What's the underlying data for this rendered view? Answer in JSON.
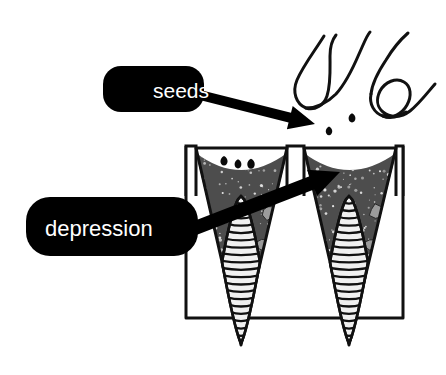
{
  "figure": {
    "background_color": "#ffffff",
    "ink_color": "#111111"
  },
  "callouts": [
    {
      "id": "seeds",
      "label": "seeds",
      "bubble_color": "#000000",
      "text_color": "#ffffff",
      "font_size": 21,
      "bubble": {
        "x": 103,
        "y": 66,
        "width": 101,
        "height": 46,
        "radius": 18
      },
      "text_pos": {
        "x": 153,
        "y": 98
      },
      "arrow": {
        "name": "seeds-arrow",
        "from": {
          "x": 196,
          "y": 94
        },
        "to": {
          "x": 315,
          "y": 124
        },
        "head_length": 26,
        "head_half_width": 12,
        "tail_half_width": 5
      }
    },
    {
      "id": "depression",
      "label": "depression",
      "bubble_color": "#000000",
      "text_color": "#ffffff",
      "font_size": 22,
      "bubble": {
        "x": 26,
        "y": 197,
        "width": 172,
        "height": 59,
        "radius": 24
      },
      "text_pos": {
        "x": 45,
        "y": 236
      },
      "arrow": {
        "name": "depression-arrow",
        "from": {
          "x": 190,
          "y": 230
        },
        "to": {
          "x": 340,
          "y": 172
        },
        "head_length": 30,
        "head_half_width": 14,
        "tail_half_width": 7
      }
    }
  ],
  "tray": {
    "name": "root-trainer-tray",
    "outer_box": {
      "left": 186,
      "top": 146,
      "right": 403,
      "bottom": 318
    },
    "stroke_width": 3,
    "fill": "#ffffff",
    "cells": [
      {
        "name": "cell-left",
        "top_left_x": 196,
        "top_right_x": 287,
        "apex_x": 241,
        "top_y": 148,
        "apex_y": 345,
        "soil_fill": "#4d4d4d",
        "soil_speckle": "#e8e8e8"
      },
      {
        "name": "cell-right",
        "top_left_x": 304,
        "top_right_x": 396,
        "apex_x": 349,
        "top_y": 148,
        "apex_y": 345,
        "soil_fill": "#4d4d4d",
        "soil_speckle": "#e8e8e8"
      }
    ],
    "rim_lips": [
      {
        "name": "rim-lip-left",
        "x1": 186,
        "x2": 196,
        "top": 146,
        "bottom": 196
      },
      {
        "name": "rim-lip-center",
        "x1": 287,
        "x2": 304,
        "top": 146,
        "bottom": 196
      },
      {
        "name": "rim-lip-right",
        "x1": 396,
        "x2": 403,
        "top": 146,
        "bottom": 196
      }
    ]
  },
  "soil": {
    "name": "soil-medium",
    "fill": "#4d4d4d",
    "speckle_color": "#e9e9e9",
    "speckle_count": 260,
    "depression_depth": 22,
    "surface_y_edges": 153,
    "surface_y_center": 175,
    "pebble_color": "#9b9b9b",
    "pebble_stroke": "#2a2a2a",
    "pebbles_per_cell": 4
  },
  "roots": [
    {
      "name": "taproot-left",
      "center_x": 241,
      "top_y": 196,
      "bottom_y": 343,
      "max_half_width": 19,
      "widest_at_y": 262,
      "fill": "#f0f0f0",
      "stroke": "#111111",
      "rib_count": 20
    },
    {
      "name": "taproot-right",
      "center_x": 349,
      "top_y": 196,
      "bottom_y": 343,
      "max_half_width": 19,
      "widest_at_y": 262,
      "fill": "#f0f0f0",
      "stroke": "#111111",
      "rib_count": 20
    }
  ],
  "hand": {
    "name": "hand-fingertips-line-drawing",
    "stroke": "#111111",
    "stroke_width": 3,
    "description": "Outline of thumb and forefinger tips releasing seeds"
  },
  "seeds_falling": [
    {
      "name": "seed-falling-1",
      "cx": 352,
      "cy": 118,
      "r": 4.2
    },
    {
      "name": "seed-falling-2",
      "cx": 329,
      "cy": 131,
      "r": 4.0
    },
    {
      "name": "seed-falling-3",
      "cx": 349,
      "cy": 153,
      "r": 4.4
    }
  ],
  "seeds_landed": [
    {
      "name": "seed-landed-1",
      "cx": 224,
      "cy": 161,
      "r": 4.4
    },
    {
      "name": "seed-landed-2",
      "cx": 238,
      "cy": 164,
      "r": 4.2
    },
    {
      "name": "seed-landed-3",
      "cx": 251,
      "cy": 164,
      "r": 4.6
    }
  ]
}
